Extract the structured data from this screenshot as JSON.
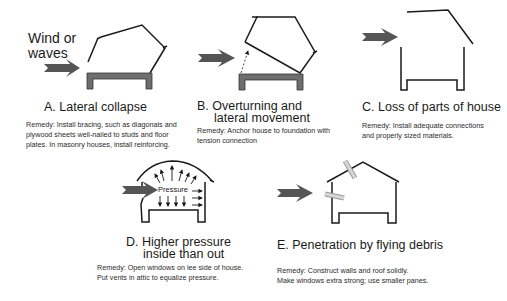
{
  "wind_label": [
    "Wind or",
    "waves"
  ],
  "pressure_label": "Pressure",
  "colors": {
    "line": "#1a1a1a",
    "arrow": "#555555",
    "foundation": "#6e6e6e",
    "debris": "#b5b5b5"
  },
  "panels": [
    {
      "id": "A",
      "title": [
        "A.  Lateral collapse"
      ],
      "remedy": [
        "Remedy: Install bracing, such as diagonals and",
        "plywood sheets well-nailed to studs and floor",
        "plates. In masonry houses, install reinforcing."
      ]
    },
    {
      "id": "B",
      "title": [
        "B.  Overturning and",
        "lateral movement"
      ],
      "remedy": [
        "Remedy: Anchor house to foundation with",
        "tension connection"
      ]
    },
    {
      "id": "C",
      "title": [
        "C.  Loss of parts of house"
      ],
      "remedy": [
        "Remedy: Install adequate connections",
        "and properly sized materials."
      ]
    },
    {
      "id": "D",
      "title": [
        "D.  Higher pressure",
        "inside than out"
      ],
      "remedy": [
        "Remedy: Open windows on lee side of house.",
        "Put vents in attic to equalize pressure."
      ]
    },
    {
      "id": "E",
      "title": [
        "E.  Penetration by flying debris"
      ],
      "remedy": [
        "Remedy: Construct walls and roof solidly.",
        "Make windows extra strong; use smaller panes."
      ]
    }
  ]
}
